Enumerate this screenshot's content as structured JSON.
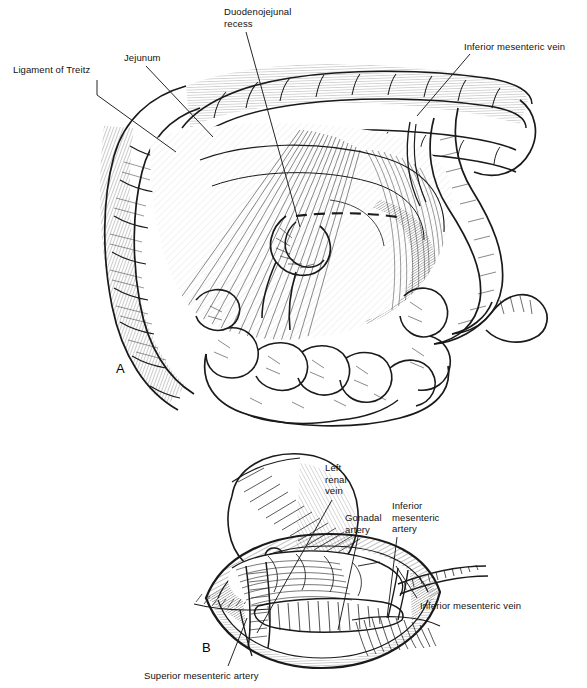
{
  "figure": {
    "type": "anatomical-line-illustration",
    "style": "pen-and-ink hatched medical illustration, black on white",
    "background_color": "#ffffff",
    "ink_color": "#1a1a1a",
    "panels": [
      {
        "id": "A",
        "letter": "A",
        "letter_x": 116,
        "letter_y": 361,
        "subject": "Transverse and descending colon reflected upward exposing the ligament of Treitz, duodenojejunal junction and inferior mesenteric vein",
        "labels": [
          {
            "id": "ligament-of-treitz",
            "text": "Ligament of Treitz",
            "x": 13,
            "y": 64,
            "align": "left",
            "leader": "M 97 80 L 97 95 L 176 152"
          },
          {
            "id": "jejunum",
            "text": "Jejunum",
            "x": 124,
            "y": 52,
            "align": "left",
            "leader": "M 146 66 L 213 137"
          },
          {
            "id": "duodenojejunal-recess",
            "text": "Duodenojejunal\nrecess",
            "x": 224,
            "y": 6,
            "align": "left",
            "leader": "M 246 32 L 300 227"
          },
          {
            "id": "inferior-mesenteric-vein",
            "text": "Inferior mesenteric vein",
            "x": 464,
            "y": 41,
            "align": "left",
            "leader": "M 470 54 L 417 116"
          }
        ]
      },
      {
        "id": "B",
        "letter": "B",
        "letter_x": 202,
        "letter_y": 640,
        "subject": "Retroperitoneal window opened at the base of the mesentery showing the left renal vein, gonadal artery, inferior mesenteric artery, inferior mesenteric vein and superior mesenteric artery, with the left kidney outlined",
        "labels": [
          {
            "id": "left-renal-vein",
            "text": "Left\nrenal\nvein",
            "x": 325,
            "y": 462,
            "align": "left",
            "leader": "M 332 500 L 257 633"
          },
          {
            "id": "gonadal-artery",
            "text": "Gonadal\nartery",
            "x": 345,
            "y": 512,
            "align": "left",
            "leader": "M 358 537 L 338 630"
          },
          {
            "id": "inferior-mesenteric-artery",
            "text": "Inferior\nmesenteric\nartery",
            "x": 392,
            "y": 500,
            "align": "left",
            "leader": "M 397 537 L 387 618"
          },
          {
            "id": "inferior-mesenteric-vein",
            "text": "Inferior mesenteric vein",
            "x": 420,
            "y": 600,
            "align": "left",
            "leader": "M 417 598 L 396 566"
          },
          {
            "id": "superior-mesenteric-artery",
            "text": "Superior mesenteric artery",
            "x": 144,
            "y": 670,
            "align": "left",
            "leader": "M 228 666 L 247 618"
          }
        ]
      }
    ]
  }
}
